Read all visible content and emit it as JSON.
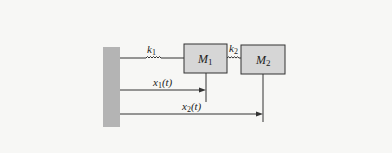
{
  "diagram": {
    "type": "mass-spring system",
    "wall": {
      "fill": "#b4b4b4"
    },
    "masses": [
      {
        "id": "M1",
        "label": "M",
        "subscript": "1",
        "fill": "#d6d6d6"
      },
      {
        "id": "M2",
        "label": "M",
        "subscript": "2",
        "fill": "#d6d6d6"
      }
    ],
    "springs": [
      {
        "id": "k1",
        "label": "k",
        "subscript": "1",
        "connects": [
          "wall",
          "M1"
        ]
      },
      {
        "id": "k2",
        "label": "k",
        "subscript": "2",
        "connects": [
          "M1",
          "M2"
        ]
      }
    ],
    "displacements": [
      {
        "id": "x1",
        "label": "x",
        "subscript": "1",
        "arg": "(t)",
        "from": "wall",
        "to": "M1"
      },
      {
        "id": "x2",
        "label": "x",
        "subscript": "2",
        "arg": "(t)",
        "from": "wall",
        "to": "M2"
      }
    ],
    "colors": {
      "line": "#333333",
      "background": "#f7f7f5"
    }
  }
}
